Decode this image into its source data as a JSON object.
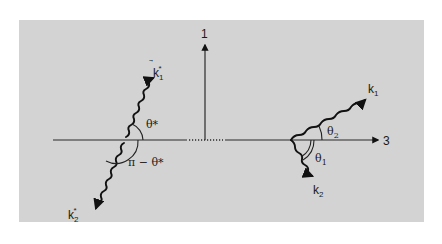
{
  "figure": {
    "background_color": "#d3d3d3",
    "page_color": "#ffffff",
    "line_color": "#1a1a1a"
  },
  "axes": {
    "vertical_label": "1",
    "horizontal_label": "3"
  },
  "left_frame": {
    "description": "Decay in rest frame (back-to-back photons)",
    "photon_1": {
      "symbol": "k",
      "subscript": "1",
      "superscript": "*"
    },
    "photon_2": {
      "symbol": "k",
      "subscript": "2",
      "superscript": "*"
    },
    "angle_label": "θ*",
    "supplementary_angle_label": "π − θ*"
  },
  "right_frame": {
    "description": "Decay in lab frame",
    "photon_1": {
      "symbol": "k",
      "subscript": "1"
    },
    "photon_2": {
      "symbol": "k",
      "subscript": "2"
    },
    "angle_1": {
      "symbol": "θ",
      "subscript": "1"
    },
    "angle_2": {
      "symbol": "θ",
      "subscript": "2"
    }
  }
}
